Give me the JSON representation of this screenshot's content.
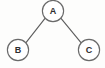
{
  "diagram": {
    "title": "Binary tree with root A and children B and C",
    "type": "tree",
    "background_color": "#fdfdfc",
    "node_fill_color": "#ffffff",
    "node_stroke_color": "#6a6a6a",
    "edge_color": "#5e5e5e",
    "label_color": "#2e2e2e",
    "nodes": [
      {
        "id": "A",
        "label": "A",
        "cx": 53,
        "cy": 11,
        "r": 10.6,
        "role": "root"
      },
      {
        "id": "B",
        "label": "B",
        "cx": 18,
        "cy": 50,
        "r": 10.6,
        "role": "left-child"
      },
      {
        "id": "C",
        "label": "C",
        "cx": 89,
        "cy": 50,
        "r": 10.6,
        "role": "right-child"
      }
    ],
    "edges": [
      {
        "id": "A-B",
        "from": "A",
        "to": "B",
        "x1": 45.2,
        "y1": 18.2,
        "x2": 25.8,
        "y2": 42.8
      },
      {
        "id": "A-C",
        "from": "A",
        "to": "C",
        "x1": 60.8,
        "y1": 18.2,
        "x2": 81.2,
        "y2": 42.8
      }
    ]
  }
}
